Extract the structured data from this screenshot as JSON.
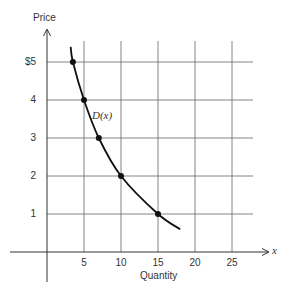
{
  "chart_data": {
    "type": "line",
    "title": "",
    "xlabel": "Quantity",
    "ylabel": "Price",
    "x_axis_symbol": "x",
    "curve_label": "D(x)",
    "x_ticks": [
      "5",
      "10",
      "15",
      "20",
      "25"
    ],
    "y_ticks": [
      "1",
      "2",
      "3",
      "4",
      "$5"
    ],
    "xlim": [
      -5,
      29
    ],
    "ylim": [
      -2,
      6
    ],
    "grid": true,
    "legend": "none",
    "series": [
      {
        "name": "D(x)",
        "points": [
          {
            "x": 3.5,
            "y": 5
          },
          {
            "x": 5,
            "y": 4
          },
          {
            "x": 7,
            "y": 3
          },
          {
            "x": 10,
            "y": 2
          },
          {
            "x": 15,
            "y": 1
          }
        ],
        "curve_extent": {
          "start": [
            3.2,
            5.4
          ],
          "end": [
            18,
            0.6
          ]
        }
      }
    ]
  },
  "labels": {
    "y_axis_title": "Price",
    "x_axis_title": "Quantity",
    "x_symbol": "x",
    "curve": "D(x)",
    "y_ticks": [
      "$5",
      "4",
      "3",
      "2",
      "1"
    ],
    "x_ticks": [
      "5",
      "10",
      "15",
      "20",
      "25"
    ]
  }
}
